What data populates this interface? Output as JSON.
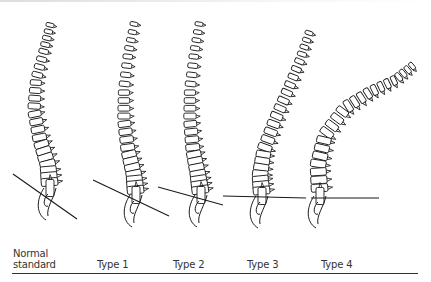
{
  "figure": {
    "spines": [
      {
        "id": "normal",
        "label_lines": [
          "Normal",
          "standard"
        ],
        "label_x": 13,
        "top": [
          37,
          25
        ],
        "curve": "normal",
        "sacral_line": [
          [
            13,
            174
          ],
          [
            77,
            219
          ]
        ]
      },
      {
        "id": "type1",
        "label_lines": [
          "Type 1"
        ],
        "label_x": 97,
        "top": [
          138,
          24
        ],
        "curve": "type1",
        "sacral_line": [
          [
            93,
            180
          ],
          [
            169,
            216
          ]
        ]
      },
      {
        "id": "type2",
        "label_lines": [
          "Type 2"
        ],
        "label_x": 173,
        "top": [
          203,
          24
        ],
        "curve": "type2",
        "sacral_line": [
          [
            158,
            187
          ],
          [
            223,
            205
          ]
        ]
      },
      {
        "id": "type3",
        "label_lines": [
          "Type 3"
        ],
        "label_x": 247,
        "top": [
          313,
          33
        ],
        "curve": "type3",
        "sacral_line": [
          [
            223,
            196
          ],
          [
            306,
            198
          ]
        ]
      },
      {
        "id": "type4",
        "label_lines": [
          "Type 4"
        ],
        "label_x": 321,
        "top": [
          416,
          66
        ],
        "curve": "type4",
        "sacral_line": [
          [
            311,
            198
          ],
          [
            379,
            198
          ]
        ]
      }
    ]
  },
  "labels": {
    "normal_1": "Normal",
    "normal_2": "standard",
    "type1": "Type 1",
    "type2": "Type 2",
    "type3": "Type 3",
    "type4": "Type 4"
  },
  "colors": {
    "ink": "#1a1a1a",
    "background": "#ffffff",
    "rule": "#333333"
  }
}
